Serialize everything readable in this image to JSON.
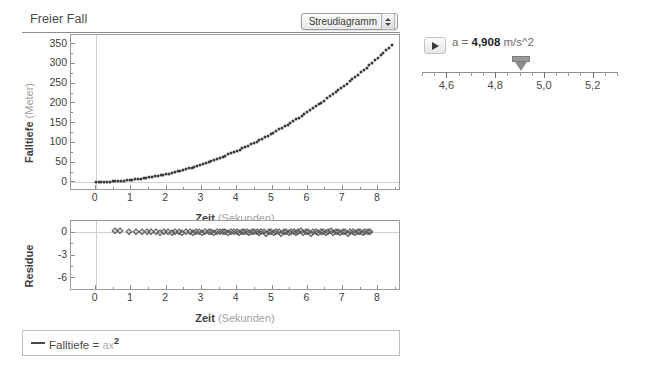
{
  "panel": {
    "title": "Freier Fall",
    "plot_type_selected": "Streudiagramm",
    "plot_type_options": [
      "Streudiagramm"
    ]
  },
  "slider": {
    "play_label": "▶",
    "param_name": "a",
    "equals": "=",
    "param_value": "4,908",
    "param_unit": "m/s^2",
    "readout": "a  =  4,908  m/s^2",
    "ticks": [
      "4,6",
      "4,8",
      "5,0",
      "5,2"
    ],
    "tick_values": [
      4.6,
      4.8,
      5.0,
      5.2
    ],
    "range": [
      4.5,
      5.3
    ],
    "thumb_value": 4.908
  },
  "legend": {
    "series_name": "Falltiefe",
    "equals": "=",
    "param": "a",
    "variable": "x",
    "exponent": "2",
    "expression": "Falltiefe = a x^2"
  },
  "chart_data": [
    {
      "type": "scatter",
      "name": "main-plot",
      "title": "Freier Fall",
      "xlabel": "Zeit",
      "xunit": "(Sekunden)",
      "ylabel": "Falltiefe",
      "yunit": "(Meter)",
      "xlim": [
        -0.7,
        8.6
      ],
      "ylim": [
        -18,
        372
      ],
      "xticks": [
        0,
        1,
        2,
        3,
        4,
        5,
        6,
        7,
        8
      ],
      "yticks": [
        0,
        50,
        100,
        150,
        200,
        250,
        300,
        350
      ],
      "grid": false,
      "zero_lines": true,
      "fit": "Falltiefe = a x^2, a = 4,908",
      "marker_color": "#3b3b3b",
      "x": [
        0.0,
        0.08,
        0.16,
        0.24,
        0.32,
        0.4,
        0.48,
        0.56,
        0.64,
        0.72,
        0.8,
        0.88,
        0.96,
        1.04,
        1.12,
        1.2,
        1.28,
        1.36,
        1.44,
        1.52,
        1.6,
        1.68,
        1.76,
        1.84,
        1.92,
        2.0,
        2.08,
        2.16,
        2.24,
        2.32,
        2.4,
        2.48,
        2.56,
        2.64,
        2.72,
        2.8,
        2.88,
        2.96,
        3.04,
        3.12,
        3.2,
        3.28,
        3.36,
        3.44,
        3.52,
        3.6,
        3.68,
        3.76,
        3.84,
        3.92,
        4.0,
        4.08,
        4.16,
        4.24,
        4.32,
        4.4,
        4.48,
        4.56,
        4.64,
        4.72,
        4.8,
        4.88,
        4.96,
        5.04,
        5.12,
        5.2,
        5.28,
        5.36,
        5.44,
        5.52,
        5.6,
        5.68,
        5.76,
        5.84,
        5.92,
        6.0,
        6.08,
        6.16,
        6.24,
        6.32,
        6.4,
        6.48,
        6.56,
        6.64,
        6.72,
        6.8,
        6.88,
        6.96,
        7.04,
        7.12,
        7.2,
        7.28,
        7.36,
        7.44,
        7.52,
        7.6,
        7.68,
        7.76,
        7.84,
        7.92,
        8.0,
        8.08,
        8.16,
        8.24,
        8.32,
        8.4
      ],
      "y": [
        0.0,
        0.0,
        0.1,
        0.3,
        0.5,
        0.8,
        1.1,
        1.5,
        2.0,
        2.5,
        3.1,
        3.8,
        4.5,
        5.3,
        6.2,
        7.1,
        8.0,
        9.1,
        10.2,
        11.3,
        12.6,
        13.9,
        15.2,
        16.6,
        18.1,
        19.6,
        21.2,
        22.9,
        24.6,
        26.4,
        28.3,
        30.2,
        32.2,
        34.2,
        36.3,
        38.5,
        40.7,
        43.0,
        45.4,
        47.8,
        50.3,
        52.8,
        55.4,
        58.1,
        60.8,
        63.6,
        66.5,
        69.4,
        72.4,
        75.4,
        78.5,
        81.7,
        84.9,
        88.2,
        91.6,
        95.0,
        98.5,
        102.0,
        105.6,
        109.3,
        113.1,
        116.9,
        120.7,
        124.7,
        128.7,
        132.7,
        136.8,
        141.0,
        145.3,
        149.6,
        153.9,
        158.4,
        162.8,
        167.4,
        172.0,
        176.7,
        181.4,
        186.2,
        191.1,
        196.0,
        201.0,
        206.1,
        211.2,
        216.4,
        221.6,
        226.9,
        232.3,
        237.7,
        243.2,
        248.8,
        254.4,
        260.1,
        265.8,
        271.6,
        277.5,
        283.4,
        289.4,
        295.5,
        301.6,
        307.8,
        314.1,
        320.4,
        326.8,
        333.2,
        339.7,
        346.3
      ]
    },
    {
      "type": "scatter",
      "name": "residual-plot",
      "xlabel": "Zeit",
      "xunit": "(Sekunden)",
      "ylabel": "Residue",
      "xlim": [
        -0.7,
        8.6
      ],
      "ylim": [
        -7.5,
        1.5
      ],
      "xticks": [
        0,
        1,
        2,
        3,
        4,
        5,
        6,
        7,
        8
      ],
      "yticks": [
        0,
        -3,
        -6
      ],
      "grid": false,
      "zero_lines": true,
      "marker_color": "#5a5a5a",
      "x": [
        0.55,
        0.7,
        0.95,
        1.15,
        1.3,
        1.45,
        1.58,
        1.7,
        1.82,
        1.93,
        2.04,
        2.15,
        2.26,
        2.36,
        2.46,
        2.56,
        2.66,
        2.75,
        2.84,
        2.93,
        3.02,
        3.11,
        3.2,
        3.28,
        3.36,
        3.44,
        3.52,
        3.6,
        3.68,
        3.76,
        3.84,
        3.92,
        4.0,
        4.07,
        4.14,
        4.21,
        4.28,
        4.35,
        4.42,
        4.49,
        4.56,
        4.63,
        4.7,
        4.77,
        4.84,
        4.91,
        4.98,
        5.05,
        5.12,
        5.19,
        5.26,
        5.33,
        5.4,
        5.47,
        5.54,
        5.61,
        5.68,
        5.75,
        5.82,
        5.89,
        5.96,
        6.03,
        6.1,
        6.17,
        6.24,
        6.31,
        6.38,
        6.45,
        6.52,
        6.59,
        6.66,
        6.73,
        6.8,
        6.87,
        6.94,
        7.01,
        7.08,
        7.15,
        7.22,
        7.29,
        7.36,
        7.43,
        7.5,
        7.57,
        7.64,
        7.71,
        7.78
      ],
      "y": [
        0.2,
        0.2,
        0.1,
        0.1,
        0.0,
        0.1,
        0.0,
        0.0,
        -0.1,
        0.0,
        0.0,
        -0.1,
        0.0,
        0.0,
        -0.1,
        0.0,
        0.0,
        -0.1,
        0.0,
        0.0,
        -0.1,
        0.0,
        0.1,
        0.0,
        -0.1,
        0.0,
        0.0,
        0.1,
        0.0,
        -0.1,
        0.0,
        0.1,
        0.0,
        -0.1,
        0.0,
        0.1,
        0.0,
        -0.1,
        0.0,
        0.0,
        0.1,
        -0.1,
        0.0,
        0.1,
        -0.2,
        0.0,
        0.1,
        -0.1,
        0.0,
        0.1,
        -0.2,
        0.0,
        0.1,
        -0.1,
        0.0,
        0.1,
        -0.1,
        0.0,
        0.2,
        -0.1,
        0.0,
        0.1,
        -0.2,
        0.0,
        0.1,
        -0.1,
        0.0,
        0.1,
        -0.1,
        0.0,
        0.2,
        -0.1,
        0.0,
        0.1,
        -0.1,
        0.0,
        0.1,
        -0.2,
        0.0,
        0.1,
        -0.1,
        0.0,
        0.1,
        -0.1,
        0.0,
        0.1,
        0.0
      ]
    }
  ]
}
